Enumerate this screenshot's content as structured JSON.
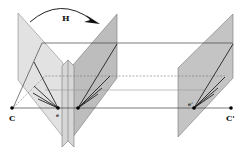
{
  "diagram": {
    "type": "epipolar-homography",
    "labels": {
      "homography": "H",
      "camera_left": "C",
      "camera_right": "C'",
      "epipole_left": "e",
      "epipole_right": "e'"
    },
    "colors": {
      "plane_light": "#e2e2e2",
      "plane_dark": "#bdbdbd",
      "plane_right": "#c4c4c4",
      "strip": "#d6d6d6",
      "line": "#333333",
      "baseline": "#555555",
      "dashed": "#777777",
      "point": "#000000"
    },
    "planes": [
      {
        "name": "left-image-plane-original",
        "shade": "light"
      },
      {
        "name": "left-image-plane-rectified",
        "shade": "dark"
      },
      {
        "name": "right-image-plane",
        "shade": "dark"
      }
    ]
  }
}
